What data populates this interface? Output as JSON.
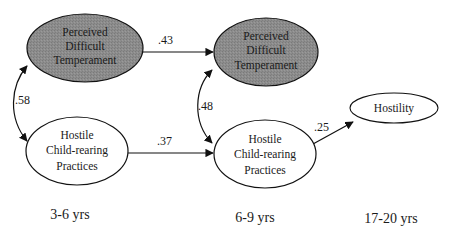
{
  "diagram": {
    "type": "path-model",
    "colors": {
      "shaded_fill": "#8c8c8c",
      "plain_fill": "#ffffff",
      "stroke": "#111111",
      "text": "#1a1a1a"
    },
    "nodes": {
      "pdt_early": {
        "lines": [
          "Perceived",
          "Difficult",
          "Temperament"
        ],
        "shaded": true
      },
      "hcp_early": {
        "lines": [
          "Hostile",
          "Child-rearing",
          "Practices"
        ],
        "shaded": false
      },
      "pdt_mid": {
        "lines": [
          "Perceived",
          "Difficult",
          "Temperament"
        ],
        "shaded": true
      },
      "hcp_mid": {
        "lines": [
          "Hostile",
          "Child-rearing",
          "Practices"
        ],
        "shaded": false
      },
      "hostility": {
        "lines": [
          "Hostility"
        ],
        "shaded": false
      }
    },
    "edges": {
      "pdt_early_to_pdt_mid": {
        "coef": ".43",
        "type": "directed"
      },
      "hcp_early_to_hcp_mid": {
        "coef": ".37",
        "type": "directed"
      },
      "pdt_early_hcp_early": {
        "coef": ".58",
        "type": "correlation"
      },
      "pdt_mid_hcp_mid": {
        "coef": ".48",
        "type": "correlation"
      },
      "hcp_mid_to_hostility": {
        "coef": ".25",
        "type": "directed"
      }
    },
    "time_labels": {
      "t1": "3-6 yrs",
      "t2": "6-9 yrs",
      "t3": "17-20 yrs"
    }
  }
}
